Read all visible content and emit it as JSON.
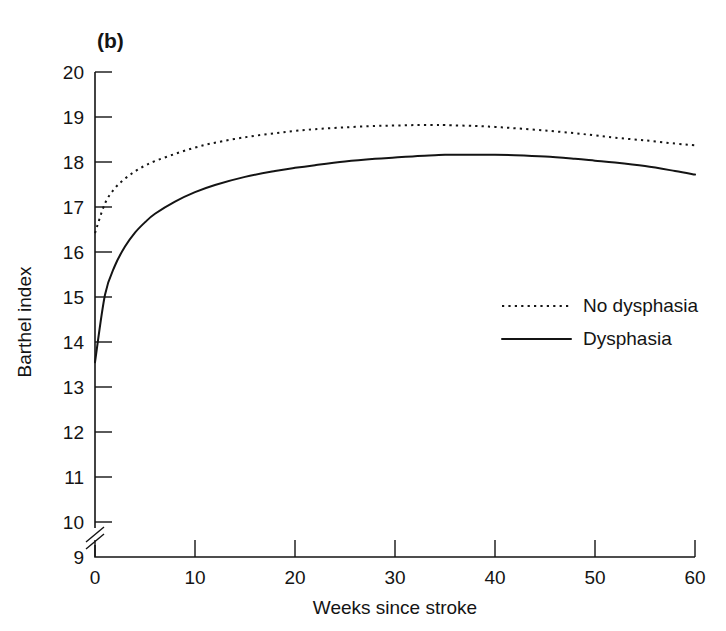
{
  "figure": {
    "panel_label": "(b)",
    "background_color": "#ffffff",
    "ink_color": "#141414"
  },
  "chart_data": {
    "type": "line",
    "title": "(b)",
    "xlabel": "Weeks since stroke",
    "ylabel": "Barthel index",
    "xlim": [
      0,
      60
    ],
    "ylim": [
      9,
      20
    ],
    "y_axis_break": {
      "present": true,
      "between": [
        9,
        10
      ]
    },
    "grid": false,
    "legend_position": "right-middle",
    "xticks": [
      0,
      10,
      20,
      30,
      40,
      50,
      60
    ],
    "xtick_labels": [
      "0",
      "10",
      "20",
      "30",
      "40",
      "50",
      "60"
    ],
    "yticks": [
      9,
      10,
      11,
      12,
      13,
      14,
      15,
      16,
      17,
      18,
      19,
      20
    ],
    "ytick_labels": [
      "9",
      "10",
      "11",
      "12",
      "13",
      "14",
      "15",
      "16",
      "17",
      "18",
      "19",
      "20"
    ],
    "x": [
      0,
      1,
      2,
      3,
      4,
      5,
      6,
      8,
      10,
      12,
      15,
      18,
      20,
      22,
      25,
      28,
      30,
      32,
      34,
      35,
      38,
      40,
      42,
      45,
      48,
      50,
      52,
      55,
      58,
      60
    ],
    "series": [
      {
        "name": "No dysphasia",
        "style": "dotted",
        "color": "#141414",
        "values": [
          16.42,
          17.08,
          17.42,
          17.63,
          17.79,
          17.92,
          18.02,
          18.18,
          18.32,
          18.43,
          18.55,
          18.64,
          18.69,
          18.73,
          18.77,
          18.8,
          18.81,
          18.82,
          18.82,
          18.82,
          18.8,
          18.78,
          18.75,
          18.7,
          18.64,
          18.59,
          18.54,
          18.48,
          18.41,
          18.37
        ]
      },
      {
        "name": "Dysphasia",
        "style": "solid",
        "color": "#141414",
        "values": [
          13.55,
          15.05,
          15.7,
          16.12,
          16.43,
          16.66,
          16.85,
          17.12,
          17.33,
          17.49,
          17.67,
          17.8,
          17.87,
          17.93,
          18.01,
          18.07,
          18.1,
          18.13,
          18.15,
          18.16,
          18.16,
          18.16,
          18.15,
          18.12,
          18.07,
          18.03,
          17.99,
          17.91,
          17.8,
          17.72
        ]
      }
    ]
  },
  "legend": {
    "items": [
      {
        "label": "No dysphasia",
        "style": "dotted"
      },
      {
        "label": "Dysphasia",
        "style": "solid"
      }
    ]
  }
}
